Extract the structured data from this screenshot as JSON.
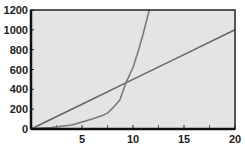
{
  "chart_data": {
    "type": "line",
    "title": "",
    "xlabel": "",
    "ylabel": "",
    "xlim": [
      0,
      20
    ],
    "ylim": [
      0,
      1200
    ],
    "x_ticks": [
      5,
      10,
      15,
      20
    ],
    "x_minor_ticks": [
      2.5,
      7.5,
      12.5,
      17.5
    ],
    "y_ticks": [
      0,
      200,
      400,
      600,
      800,
      1000,
      1200
    ],
    "grid": false,
    "legend": null,
    "background": "#e4e4e4",
    "series": [
      {
        "name": "linear",
        "color": "#666666",
        "x": [
          0,
          5,
          10,
          15,
          20
        ],
        "y": [
          0,
          250,
          500,
          750,
          1000
        ]
      },
      {
        "name": "exponential",
        "color": "#7a7a7a",
        "x": [
          0,
          2,
          4,
          5,
          6,
          7,
          7.5,
          8,
          8.7,
          9.3,
          10,
          10.5,
          11,
          11.6
        ],
        "y": [
          5,
          15,
          40,
          70,
          100,
          135,
          160,
          210,
          290,
          465,
          620,
          780,
          960,
          1200
        ]
      }
    ]
  }
}
